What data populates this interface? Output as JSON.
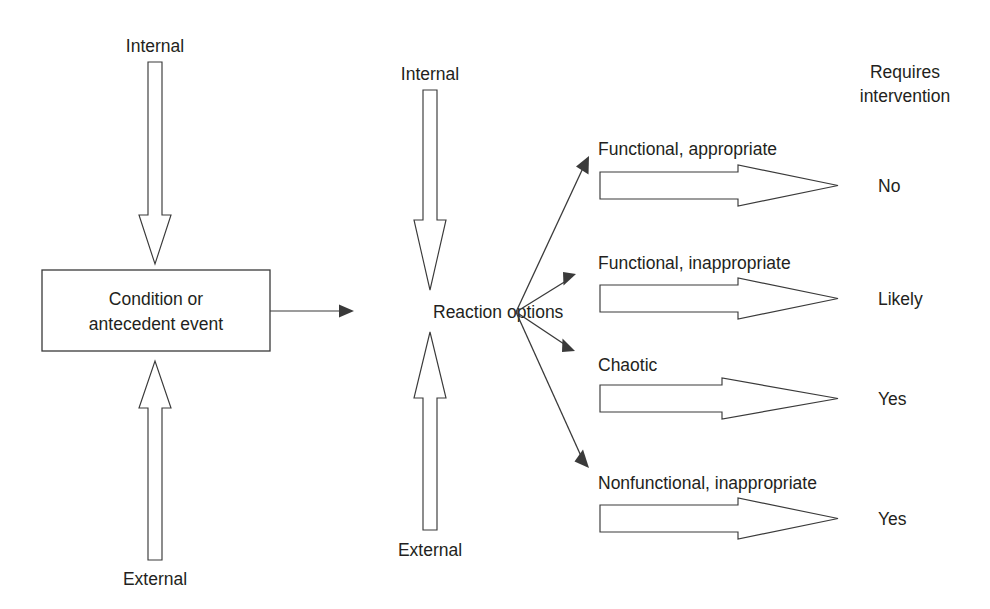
{
  "diagram": {
    "colors": {
      "stroke": "#3a3a3a",
      "text": "#231f20",
      "background": "#ffffff"
    },
    "left_group": {
      "internal_label": "Internal",
      "external_label": "External",
      "box_line_1": "Condition or",
      "box_line_2": "antecedent event"
    },
    "middle_group": {
      "internal_label": "Internal",
      "external_label": "External",
      "node_label": "Reaction options"
    },
    "right_column_header": {
      "line_1": "Requires",
      "line_2": "intervention"
    },
    "outcomes": [
      {
        "label": "Functional, appropriate",
        "requires_intervention": "No"
      },
      {
        "label": "Functional, inappropriate",
        "requires_intervention": "Likely"
      },
      {
        "label": "Chaotic",
        "requires_intervention": "Yes"
      },
      {
        "label": "Nonfunctional, inappropriate",
        "requires_intervention": "Yes"
      }
    ]
  }
}
